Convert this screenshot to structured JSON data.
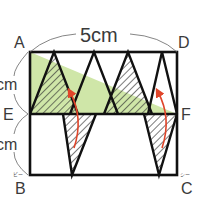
{
  "figure": {
    "type": "geometry-diagram",
    "colors": {
      "outline": "#111111",
      "green_fill": "#cfe6a8",
      "hatch": "#333333",
      "arrow": "#e0452a",
      "label": "#3a3a3a"
    }
  },
  "labels": {
    "top_dimension": "5cm",
    "left_upper_dimension": "cm",
    "left_lower_dimension": "cm",
    "vertices": {
      "A": "A",
      "D": "D",
      "E": "E",
      "F": "F",
      "B": "B",
      "C": "C"
    },
    "ruby": {
      "B": "ビー",
      "C": "シー"
    }
  },
  "geometry": {
    "rectangle": {
      "A": [
        30,
        52
      ],
      "D": [
        177,
        52
      ],
      "B": [
        30,
        175
      ],
      "C": [
        177,
        175
      ]
    },
    "midline": {
      "E": [
        30,
        114
      ],
      "F": [
        177,
        114
      ]
    },
    "green_triangle": [
      [
        30,
        52
      ],
      [
        30,
        114
      ],
      [
        177,
        114
      ]
    ],
    "upper_triangles": [
      {
        "apex": [
          54,
          52
        ],
        "base": [
          [
            30,
            114
          ],
          [
            78,
            114
          ]
        ],
        "hatched": true
      },
      {
        "apex": [
          94,
          52
        ],
        "base": [
          [
            70,
            114
          ],
          [
            118,
            114
          ]
        ],
        "hatched": false
      },
      {
        "apex": [
          128,
          52
        ],
        "base": [
          [
            104,
            114
          ],
          [
            152,
            114
          ]
        ],
        "hatched": true
      },
      {
        "apex": [
          162,
          52
        ],
        "base": [
          [
            148,
            114
          ],
          [
            177,
            114
          ]
        ],
        "hatched": false
      }
    ],
    "lower_triangles": [
      {
        "apex": [
          72,
          175
        ],
        "base": [
          [
            63,
            114
          ],
          [
            96,
            114
          ]
        ],
        "hatched": true
      },
      {
        "apex": [
          159,
          175
        ],
        "base": [
          [
            144,
            114
          ],
          [
            177,
            114
          ]
        ],
        "hatched": true
      }
    ],
    "arrows": [
      {
        "from": [
          77,
          140
        ],
        "to": [
          70,
          88
        ]
      },
      {
        "from": [
          164,
          140
        ],
        "to": [
          157,
          88
        ]
      }
    ]
  }
}
